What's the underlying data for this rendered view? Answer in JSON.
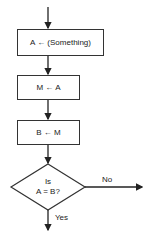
{
  "flowchart": {
    "steps": [
      {
        "id": "step-1",
        "type": "process",
        "text": "A ← (Something)"
      },
      {
        "id": "step-2",
        "type": "process",
        "text": "M ← A"
      },
      {
        "id": "step-3",
        "type": "process",
        "text": "B ← M"
      }
    ],
    "decision": {
      "line1": "Is",
      "line2": "A = B?",
      "no_label": "No",
      "yes_label": "Yes"
    }
  }
}
